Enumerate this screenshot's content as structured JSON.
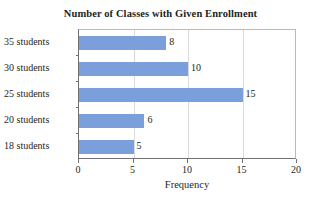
{
  "chart_data": {
    "type": "bar",
    "orientation": "horizontal",
    "title": "Number of Classes with Given Enrollment",
    "xlabel": "Frequency",
    "ylabel": "",
    "categories": [
      "18 students",
      "20 students",
      "25 students",
      "30 students",
      "35 students"
    ],
    "values": [
      5,
      6,
      15,
      10,
      8
    ],
    "value_labels": [
      "5",
      "6",
      "15",
      "10",
      "8"
    ],
    "xlim": [
      0,
      20
    ],
    "xticks": [
      0,
      5,
      10,
      15,
      20
    ],
    "xtick_labels": [
      "0",
      "5",
      "10",
      "15",
      "20"
    ],
    "grid": "vertical",
    "legend": "none",
    "bar_color": "#7b9fdb",
    "axis_color": "#6f6f74",
    "grid_color": "#d9d9de",
    "background": "#ffffff",
    "text_color": "#231f20"
  }
}
